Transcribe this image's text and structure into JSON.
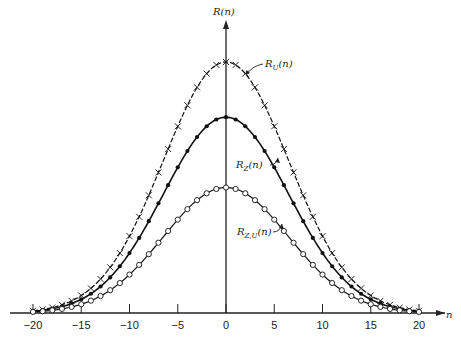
{
  "chart_data": {
    "type": "line",
    "title": "",
    "xlabel": "n",
    "ylabel": "R(n)",
    "xlim": [
      -21,
      21
    ],
    "ylim": [
      0,
      1.0
    ],
    "xticks": [
      -20,
      -15,
      -10,
      -5,
      0,
      5,
      10,
      15,
      20
    ],
    "x": [
      -20,
      -19,
      -18,
      -17,
      -16,
      -15,
      -14,
      -13,
      -12,
      -11,
      -10,
      -9,
      -8,
      -7,
      -6,
      -5,
      -4,
      -3,
      -2,
      -1,
      0,
      1,
      2,
      3,
      4,
      5,
      6,
      7,
      8,
      9,
      10,
      11,
      12,
      13,
      14,
      15,
      16,
      17,
      18,
      19,
      20
    ],
    "series": [
      {
        "name": "R_U(n)",
        "label": "R_U(n)",
        "marker": "x",
        "peak": 1.0,
        "sigma": 6.5
      },
      {
        "name": "R_Z(n)",
        "label": "R_Z(n)",
        "marker": "filled-dot",
        "peak": 0.78,
        "sigma": 6.5
      },
      {
        "name": "R_Z,U(n)",
        "label": "R_Z,U(n)",
        "marker": "open-circle",
        "peak": 0.5,
        "sigma": 6.5
      }
    ],
    "legend": "inline annotations with arrows",
    "grid": false
  },
  "labels": {
    "yaxis": "R(n)",
    "xaxis": "n",
    "ru": "R",
    "ru_sub": "U",
    "rz": "R",
    "rz_sub": "Z",
    "rzu": "R",
    "rzu_sub": "Z,U",
    "arg": "(n)"
  }
}
